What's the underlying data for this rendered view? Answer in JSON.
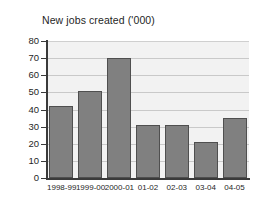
{
  "chart_data": {
    "type": "bar",
    "title": "New jobs created ('000)",
    "xlabel": "",
    "ylabel": "",
    "categories": [
      "1998-99",
      "1999-00",
      "2000-01",
      "01-02",
      "02-03",
      "03-04",
      "04-05"
    ],
    "values": [
      42,
      51,
      70,
      31,
      31,
      21,
      35
    ],
    "ylim": [
      0,
      80
    ],
    "ytick_step": 10,
    "yticks": [
      0,
      10,
      20,
      30,
      40,
      50,
      60,
      70,
      80
    ],
    "ytick_labels": [
      "0",
      "10",
      "20",
      "30",
      "40",
      "50",
      "60",
      "70",
      "80"
    ],
    "grid": true,
    "grid_axis": "y",
    "legend": false,
    "legend_position": "none",
    "bar_color": "#808080",
    "bar_edge_color": "#4f4f4f",
    "plot_background": "#f2f2f2",
    "gridline_color": "#c9c9c9",
    "axis_color": "#3a3a3a",
    "figure_background": "#ffffff",
    "text_color": "#1f1f1f"
  }
}
